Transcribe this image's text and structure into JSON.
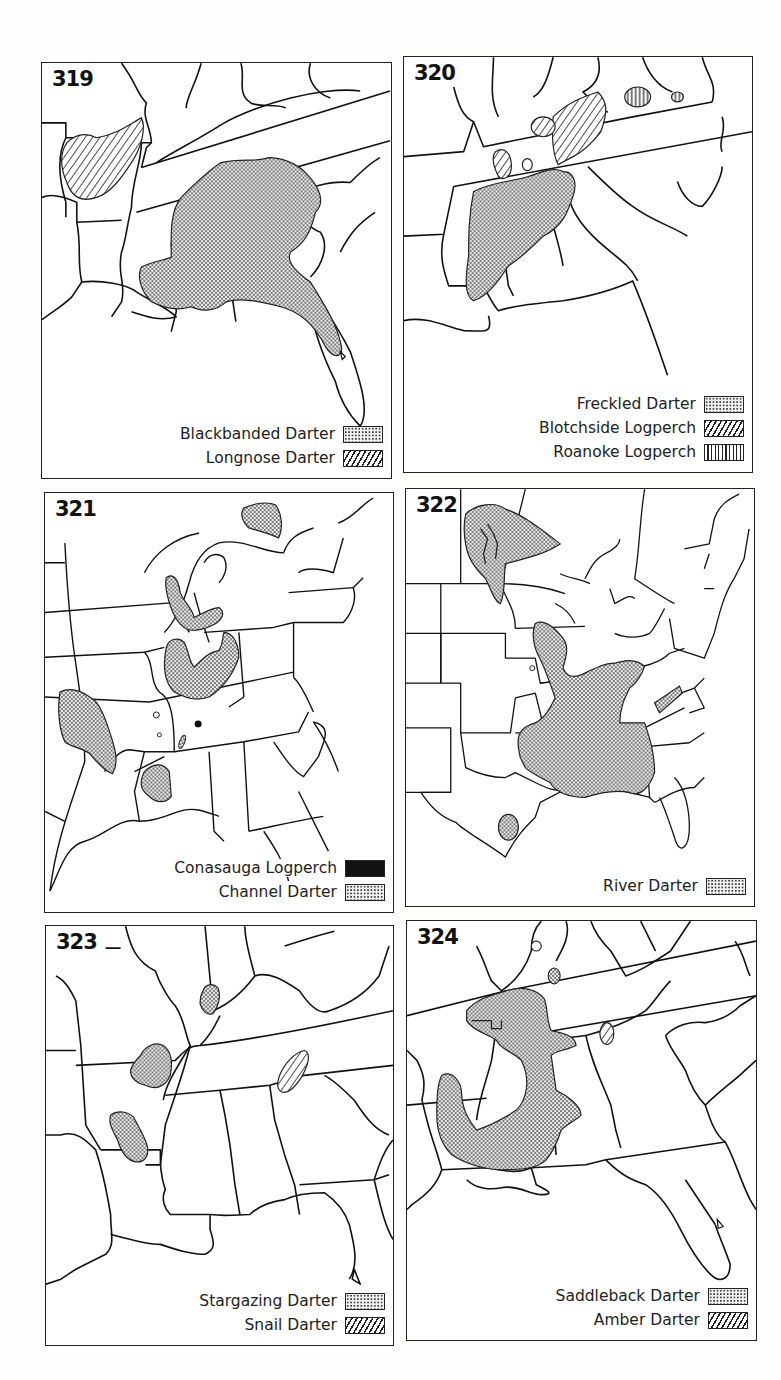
{
  "figure_type": "species range maps",
  "panels": [
    {
      "number": "319",
      "region": "Southeastern United States",
      "legend": [
        {
          "label": "Blackbanded Darter",
          "pattern": "stipple"
        },
        {
          "label": "Longnose Darter",
          "pattern": "diagonal-hatch"
        }
      ]
    },
    {
      "number": "320",
      "region": "Southeastern United States",
      "legend": [
        {
          "label": "Freckled Darter",
          "pattern": "stipple"
        },
        {
          "label": "Blotchside Logperch",
          "pattern": "diagonal-hatch"
        },
        {
          "label": "Roanoke Logperch",
          "pattern": "vertical-lines"
        }
      ]
    },
    {
      "number": "321",
      "region": "Eastern United States and Great Lakes",
      "legend": [
        {
          "label": "Conasauga Logperch",
          "pattern": "solid-black"
        },
        {
          "label": "Channel Darter",
          "pattern": "stipple"
        }
      ]
    },
    {
      "number": "322",
      "region": "Eastern and central North America",
      "legend": [
        {
          "label": "River Darter",
          "pattern": "stipple"
        }
      ]
    },
    {
      "number": "323",
      "region": "South-central United States",
      "legend": [
        {
          "label": "Stargazing Darter",
          "pattern": "stipple"
        },
        {
          "label": "Snail Darter",
          "pattern": "diagonal-hatch"
        }
      ]
    },
    {
      "number": "324",
      "region": "Southeastern United States",
      "legend": [
        {
          "label": "Saddleback Darter",
          "pattern": "stipple"
        },
        {
          "label": "Amber Darter",
          "pattern": "diagonal-hatch"
        }
      ]
    }
  ],
  "colors": {
    "ink": "#111111",
    "paper": "#ffffff",
    "stipple_fill": "#d9d9d9"
  }
}
